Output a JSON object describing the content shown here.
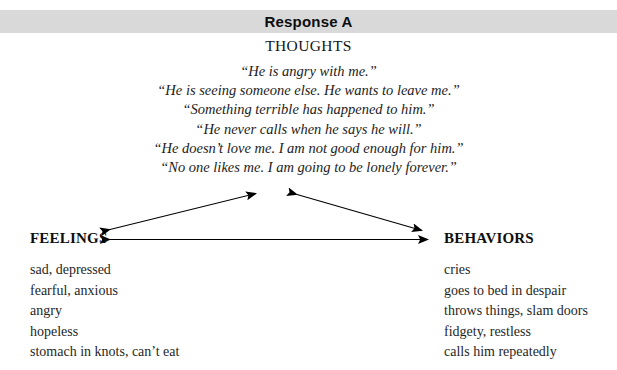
{
  "header": {
    "title": "Response A",
    "band_color": "#d9d9d9"
  },
  "thoughts": {
    "heading": "THOUGHTS",
    "lines": [
      "“He is angry with me.”",
      "“He is seeing someone else. He wants to leave me.”",
      "“Something terrible has happened to him.”",
      "“He never calls when he says he will.”",
      "“He doesn’t love me. I am not good enough for him.”",
      "“No one likes me. I am going to be lonely forever.”"
    ]
  },
  "feelings": {
    "heading": "FEELINGS",
    "items": [
      "sad, depressed",
      "fearful, anxious",
      "angry",
      "hopeless",
      "stomach in knots, can’t eat"
    ]
  },
  "behaviors": {
    "heading": "BEHAVIORS",
    "items": [
      "cries",
      "goes to bed in despair",
      "throws things, slam doors",
      "fidgety, restless",
      "calls him repeatedly"
    ]
  },
  "diagram": {
    "line_color": "#000000",
    "arrows": [
      "feelings-thoughts-double-arrow",
      "thoughts-behaviors-double-arrow",
      "feelings-behaviors-double-arrow"
    ]
  }
}
